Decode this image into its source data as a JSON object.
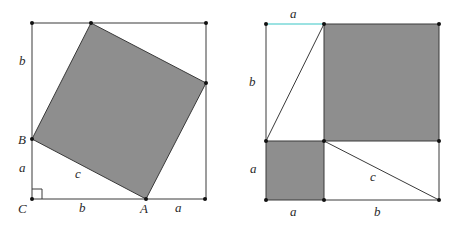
{
  "figure": {
    "colors": {
      "shade": "#8e8e8e",
      "line": "#3a3a3a",
      "accent_segment": "#39c6c6"
    },
    "left": {
      "points": {
        "C": "C",
        "B": "B",
        "A": "A"
      },
      "labels": {
        "left_top": "b",
        "left_bottom": "a",
        "hypotenuse": "c",
        "bottom_left": "b",
        "bottom_right": "a"
      },
      "shaded_region": "square of side c"
    },
    "right": {
      "labels": {
        "top": "a",
        "left_top": "b",
        "left_bottom": "a",
        "hypotenuse": "c",
        "bottom_left": "a",
        "bottom_right": "b"
      },
      "shaded_regions": [
        "square of side a",
        "square of side b"
      ]
    }
  }
}
